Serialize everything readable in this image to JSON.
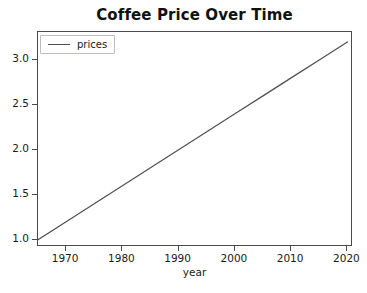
{
  "chart_data": {
    "type": "line",
    "title": "Coffee Price Over Time",
    "xlabel": "year",
    "ylabel": "",
    "xlim": [
      1965,
      2021
    ],
    "ylim": [
      0.92,
      3.31
    ],
    "grid": false,
    "legend_position": "upper left",
    "x_ticks": [
      1970,
      1980,
      1990,
      2000,
      2010,
      2020
    ],
    "x_tick_labels": [
      "1970",
      "1980",
      "1990",
      "2000",
      "2010",
      "2020"
    ],
    "y_ticks": [
      1.0,
      1.5,
      2.0,
      2.5,
      3.0
    ],
    "y_tick_labels": [
      "1.0",
      "1.5",
      "2.0",
      "2.5",
      "3.0"
    ],
    "line_color": "#4f4f4f",
    "series": [
      {
        "name": "prices",
        "x": [
          1965,
          1970,
          1975,
          1980,
          1985,
          1990,
          1995,
          2000,
          2005,
          2010,
          2015,
          2020
        ],
        "values": [
          1.0,
          1.2,
          1.4,
          1.6,
          1.8,
          2.0,
          2.2,
          2.4,
          2.6,
          2.8,
          3.0,
          3.2
        ]
      }
    ]
  },
  "legend": {
    "entries": [
      {
        "label": "prices",
        "color": "#4f4f4f"
      }
    ]
  }
}
